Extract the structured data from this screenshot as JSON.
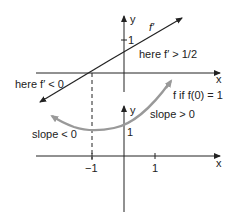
{
  "diagram": {
    "top_plot": {
      "x_axis_label": "x",
      "y_axis_label": "y",
      "y_tick_label": "1",
      "curve_label": "f′",
      "annotation_right": "here f′ > 1/2",
      "annotation_left": "here f′ < 0"
    },
    "bottom_plot": {
      "x_axis_label": "x",
      "y_axis_label": "y",
      "y_tick_label": "1",
      "x_tick_labels": [
        "−1",
        "1"
      ],
      "curve_label": "f if f(0) = 1",
      "annotation_right": "slope > 0",
      "annotation_left": "slope < 0"
    },
    "colors": {
      "ink": "#222222",
      "curve_gray": "#999999"
    }
  }
}
